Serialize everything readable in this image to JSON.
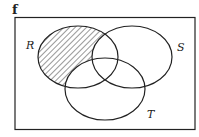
{
  "figure": {
    "panel_label": "f",
    "sets": [
      {
        "name": "R",
        "cx": 78,
        "cy": 57,
        "rx": 40,
        "ry": 31
      },
      {
        "name": "S",
        "cx": 132,
        "cy": 57,
        "rx": 40,
        "ry": 31
      },
      {
        "name": "T",
        "cx": 105,
        "cy": 89,
        "rx": 40,
        "ry": 31
      }
    ],
    "shaded_region": "R only (R minus S and T)",
    "labels": {
      "R": "R",
      "S": "S",
      "T": "T"
    }
  }
}
